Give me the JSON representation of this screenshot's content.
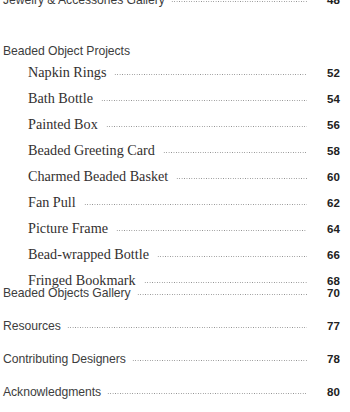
{
  "document": {
    "type": "table-of-contents",
    "background_color": "#ffffff",
    "text_color": "#3b3b3b",
    "leader_color": "#8d8d8d",
    "pageno_color": "#222222"
  },
  "entries": [
    {
      "label": "Jewelry & Accessories Gallery",
      "page": "48",
      "level": 0,
      "top": -8,
      "leader": true
    },
    {
      "label": "Beaded Object Projects",
      "page": "",
      "level": 0,
      "top": 44,
      "leader": false
    },
    {
      "label": "Napkin Rings",
      "page": "52",
      "level": 1,
      "top": 64,
      "leader": true
    },
    {
      "label": "Bath Bottle",
      "page": "54",
      "level": 1,
      "top": 90,
      "leader": true
    },
    {
      "label": "Painted Box",
      "page": "56",
      "level": 1,
      "top": 116,
      "leader": true
    },
    {
      "label": "Beaded Greeting Card",
      "page": "58",
      "level": 1,
      "top": 142,
      "leader": true
    },
    {
      "label": "Charmed Beaded Basket",
      "page": "60",
      "level": 1,
      "top": 168,
      "leader": true
    },
    {
      "label": "Fan Pull",
      "page": "62",
      "level": 1,
      "top": 194,
      "leader": true
    },
    {
      "label": "Picture Frame",
      "page": "64",
      "level": 1,
      "top": 220,
      "leader": true
    },
    {
      "label": "Bead-wrapped Bottle",
      "page": "66",
      "level": 1,
      "top": 246,
      "leader": true
    },
    {
      "label": "Fringed Bookmark",
      "page": "68",
      "level": 1,
      "top": 272,
      "leader": true
    },
    {
      "label": "Beaded Objects Gallery",
      "page": "70",
      "level": 0,
      "top": 285,
      "leader": true
    },
    {
      "label": "Resources",
      "page": "77",
      "level": 0,
      "top": 318,
      "leader": true
    },
    {
      "label": "Contributing Designers",
      "page": "78",
      "level": 0,
      "top": 351,
      "leader": true
    },
    {
      "label": "Acknowledgments",
      "page": "80",
      "level": 0,
      "top": 384,
      "leader": true
    }
  ]
}
